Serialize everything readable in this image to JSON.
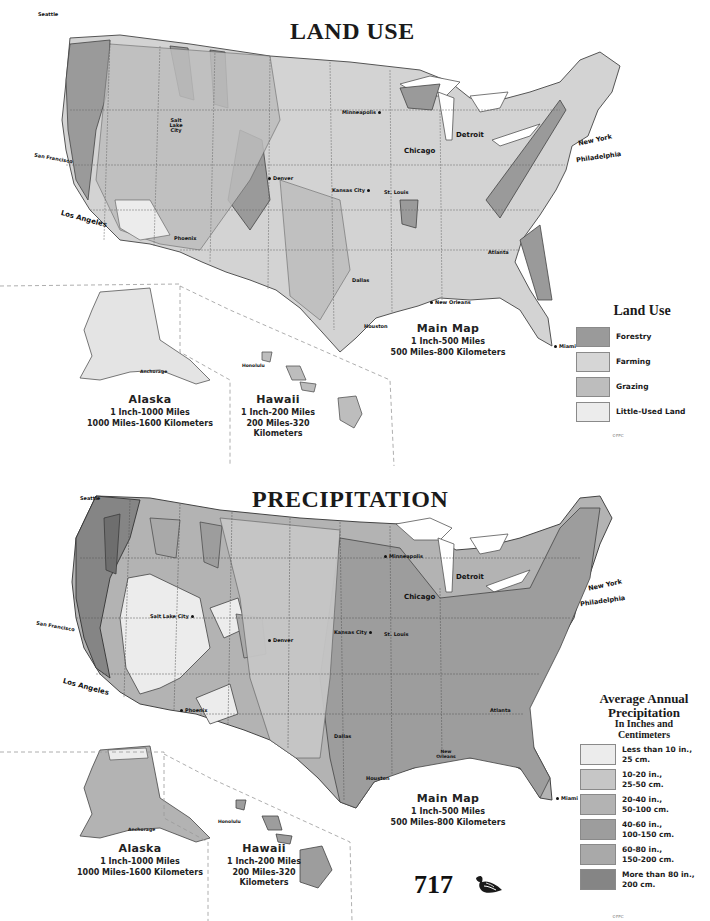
{
  "page_number": "717",
  "ornament_icon": "feather-ornament-icon",
  "maps": [
    {
      "id": "land-use",
      "title": "LAND USE",
      "cities": [
        {
          "name": "Seattle",
          "x": 34,
          "y": 12
        },
        {
          "name": "Salt Lake City",
          "x": 180,
          "y": 120
        },
        {
          "name": "San Francisco",
          "x": 34,
          "y": 158
        },
        {
          "name": "Los Angeles",
          "x": 60,
          "y": 218
        },
        {
          "name": "Phoenix",
          "x": 174,
          "y": 238
        },
        {
          "name": "Denver",
          "x": 266,
          "y": 178
        },
        {
          "name": "Minneapolis",
          "x": 342,
          "y": 112
        },
        {
          "name": "Chicago",
          "x": 404,
          "y": 152
        },
        {
          "name": "Detroit",
          "x": 456,
          "y": 136
        },
        {
          "name": "Kansas City",
          "x": 332,
          "y": 190
        },
        {
          "name": "St. Louis",
          "x": 384,
          "y": 192
        },
        {
          "name": "New York",
          "x": 578,
          "y": 140
        },
        {
          "name": "Philadelphia",
          "x": 576,
          "y": 156
        },
        {
          "name": "Atlanta",
          "x": 488,
          "y": 252
        },
        {
          "name": "Dallas",
          "x": 352,
          "y": 278
        },
        {
          "name": "New Orleans",
          "x": 428,
          "y": 302
        },
        {
          "name": "Houston",
          "x": 364,
          "y": 326
        },
        {
          "name": "Miami",
          "x": 556,
          "y": 346
        },
        {
          "name": "Anchorage",
          "x": 136,
          "y": 372
        },
        {
          "name": "Honolulu",
          "x": 244,
          "y": 366
        }
      ],
      "scales": {
        "main": {
          "title": "Main Map",
          "line1": "1 Inch-500 Miles",
          "line2": "500 Miles-800 Kilometers"
        },
        "alaska": {
          "title": "Alaska",
          "line1": "1 Inch-1000 Miles",
          "line2": "1000 Miles-1600 Kilometers"
        },
        "hawaii": {
          "title": "Hawaii",
          "line1": "1 Inch-200 Miles",
          "line2": "200 Miles-320",
          "line3": "Kilometers"
        }
      },
      "legend": {
        "title": "Land Use",
        "items": [
          {
            "label": "Forestry",
            "color": "#9a9a9a"
          },
          {
            "label": "Farming",
            "color": "#d6d6d6"
          },
          {
            "label": "Grazing",
            "color": "#bdbdbd"
          },
          {
            "label": "Little-Used Land",
            "color": "#ececec"
          }
        ],
        "copyright": "©FPC"
      }
    },
    {
      "id": "precipitation",
      "title": "PRECIPITATION",
      "cities": [
        {
          "name": "Seattle",
          "x": 80,
          "y": 22
        },
        {
          "name": "Salt Lake City",
          "x": 150,
          "y": 136
        },
        {
          "name": "San Francisco",
          "x": 36,
          "y": 148
        },
        {
          "name": "Los Angeles",
          "x": 62,
          "y": 208
        },
        {
          "name": "Phoenix",
          "x": 178,
          "y": 232
        },
        {
          "name": "Denver",
          "x": 268,
          "y": 162
        },
        {
          "name": "Minneapolis",
          "x": 382,
          "y": 78
        },
        {
          "name": "Chicago",
          "x": 404,
          "y": 120
        },
        {
          "name": "Detroit",
          "x": 456,
          "y": 100
        },
        {
          "name": "Kansas City",
          "x": 334,
          "y": 154
        },
        {
          "name": "St. Louis",
          "x": 384,
          "y": 156
        },
        {
          "name": "New York",
          "x": 588,
          "y": 108
        },
        {
          "name": "Philadelphia",
          "x": 580,
          "y": 124
        },
        {
          "name": "Atlanta",
          "x": 490,
          "y": 232
        },
        {
          "name": "Dallas",
          "x": 334,
          "y": 258
        },
        {
          "name": "New Orleans",
          "x": 434,
          "y": 276
        },
        {
          "name": "Houston",
          "x": 366,
          "y": 300
        },
        {
          "name": "Miami",
          "x": 556,
          "y": 320
        },
        {
          "name": "Anchorage",
          "x": 132,
          "y": 352
        },
        {
          "name": "Honolulu",
          "x": 244,
          "y": 344
        }
      ],
      "scales": {
        "main": {
          "title": "Main Map",
          "line1": "1 Inch-500 Miles",
          "line2": "500 Miles-800 Kilometers"
        },
        "alaska": {
          "title": "Alaska",
          "line1": "1 Inch-1000 Miles",
          "line2": "1000 Miles-1600 Kilometers"
        },
        "hawaii": {
          "title": "Hawaii",
          "line1": "1 Inch-200 Miles",
          "line2": "200 Miles-320",
          "line3": "Kilometers"
        }
      },
      "legend": {
        "title_line1": "Average Annual",
        "title_line2": "Precipitation",
        "subtitle_line1": "In Inches and",
        "subtitle_line2": "Centimeters",
        "items": [
          {
            "label": "Less than 10 in.,\n25 cm.",
            "color": "#ececec"
          },
          {
            "label": "10-20 in.,\n25-50 cm.",
            "color": "#c6c6c6"
          },
          {
            "label": "20-40 in.,\n50-100 cm.",
            "color": "#b3b3b3"
          },
          {
            "label": "40-60 in.,\n100-150 cm.",
            "color": "#9d9d9d"
          },
          {
            "label": "60-80 in.,\n150-200 cm.",
            "color": "#a9a9a9"
          },
          {
            "label": "More than 80 in.,\n200 cm.",
            "color": "#858585"
          }
        ],
        "copyright": "©FPC"
      }
    }
  ]
}
